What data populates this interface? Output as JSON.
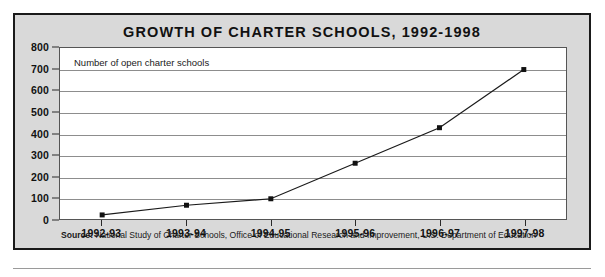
{
  "chart_data": {
    "type": "line",
    "title": "GROWTH OF CHARTER SCHOOLS, 1992-1998",
    "categories": [
      "1992-93",
      "1993-94",
      "1994-95",
      "1995-96",
      "1996-97",
      "1997-98"
    ],
    "values": [
      25,
      70,
      100,
      265,
      430,
      700
    ],
    "series": [
      {
        "name": "Number of open charter schools",
        "values": [
          25,
          70,
          100,
          265,
          430,
          700
        ]
      }
    ],
    "annotation": "Number of open charter schools",
    "xlabel": "",
    "ylabel": "",
    "ylim": [
      0,
      800
    ],
    "yticks": [
      0,
      100,
      200,
      300,
      400,
      500,
      600,
      700,
      800
    ],
    "ytick_labels": [
      "0",
      "100",
      "200",
      "300",
      "400",
      "500",
      "600",
      "700",
      "800"
    ],
    "grid": true,
    "legend": false,
    "marker": "square",
    "line_color": "#1a1a1a",
    "marker_color": "#111111",
    "plot_background": "#ffffff",
    "panel_background": "#d9d9d9",
    "grid_color": "#8d8d8d"
  },
  "source": {
    "label": "Source:",
    "text": "National Study of Charter Schools, Office of Educational Research and Improvement, U.S. Department of Education"
  }
}
